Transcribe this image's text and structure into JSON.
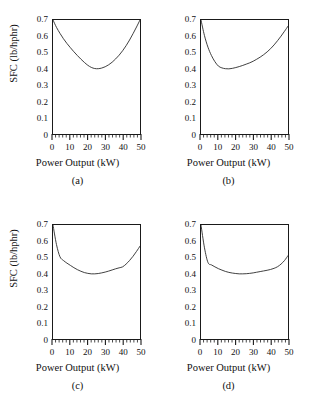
{
  "figure": {
    "background_color": "#ffffff",
    "axis_color": "#1a1a1a",
    "curve_color": "#2b2b2b"
  },
  "chart_data": [
    {
      "type": "line",
      "panel": "a",
      "caption": "(a)",
      "title": "",
      "xlabel": "Power Output (kW)",
      "ylabel": "SFC (lb/hphr)",
      "xlim": [
        0,
        50
      ],
      "ylim": [
        0,
        0.7
      ],
      "xticks": [
        0,
        10,
        20,
        30,
        40,
        50
      ],
      "xticklabels": [
        "0",
        "10",
        "20",
        "30",
        "40",
        "50"
      ],
      "yticks": [
        0,
        0.1,
        0.2,
        0.3,
        0.4,
        0.5,
        0.6,
        0.7
      ],
      "yticklabels": [
        "0",
        "0.1",
        "0.2",
        "0.3",
        "0.4",
        "0.5",
        "0.6",
        "0.7"
      ],
      "x_minor_interval": 2,
      "y_minor_interval": 0.02,
      "grid": false,
      "legend": null,
      "x": [
        0,
        2,
        4,
        6,
        8,
        10,
        12,
        14,
        16,
        18,
        20,
        22,
        24,
        26,
        28,
        30,
        32,
        34,
        36,
        38,
        40,
        42,
        44,
        46,
        48,
        50
      ],
      "y": [
        0.7,
        0.655,
        0.618,
        0.585,
        0.556,
        0.53,
        0.505,
        0.482,
        0.46,
        0.44,
        0.422,
        0.409,
        0.402,
        0.401,
        0.405,
        0.413,
        0.425,
        0.441,
        0.461,
        0.484,
        0.511,
        0.542,
        0.577,
        0.616,
        0.657,
        0.7
      ]
    },
    {
      "type": "line",
      "panel": "b",
      "caption": "(b)",
      "title": "",
      "xlabel": "Power Output (kW)",
      "ylabel": "",
      "xlim": [
        0,
        50
      ],
      "ylim": [
        0,
        0.7
      ],
      "xticks": [
        0,
        10,
        20,
        30,
        40,
        50
      ],
      "xticklabels": [
        "0",
        "10",
        "20",
        "30",
        "40",
        "50"
      ],
      "yticks": [
        0,
        0.1,
        0.2,
        0.3,
        0.4,
        0.5,
        0.6,
        0.7
      ],
      "yticklabels": [
        "0",
        "0.1",
        "0.2",
        "0.3",
        "0.4",
        "0.5",
        "0.6",
        "0.7"
      ],
      "x_minor_interval": 2,
      "y_minor_interval": 0.02,
      "grid": false,
      "legend": null,
      "x": [
        0,
        2,
        4,
        6,
        8,
        10,
        12,
        14,
        16,
        18,
        20,
        22,
        24,
        26,
        28,
        30,
        32,
        34,
        36,
        38,
        40,
        42,
        44,
        46,
        48,
        50
      ],
      "y": [
        0.7,
        0.604,
        0.533,
        0.482,
        0.444,
        0.417,
        0.406,
        0.401,
        0.4,
        0.403,
        0.408,
        0.414,
        0.421,
        0.429,
        0.437,
        0.447,
        0.459,
        0.472,
        0.487,
        0.504,
        0.524,
        0.547,
        0.573,
        0.601,
        0.631,
        0.662
      ]
    },
    {
      "type": "line",
      "panel": "c",
      "caption": "(c)",
      "title": "",
      "xlabel": "Power Output (kW)",
      "ylabel": "SFC (lb/hphr)",
      "xlim": [
        0,
        50
      ],
      "ylim": [
        0,
        0.7
      ],
      "xticks": [
        0,
        10,
        20,
        30,
        40,
        50
      ],
      "xticklabels": [
        "0",
        "10",
        "20",
        "30",
        "40",
        "50"
      ],
      "yticks": [
        0,
        0.1,
        0.2,
        0.3,
        0.4,
        0.5,
        0.6,
        0.7
      ],
      "yticklabels": [
        "0",
        "0.1",
        "0.2",
        "0.3",
        "0.4",
        "0.5",
        "0.6",
        "0.7"
      ],
      "x_minor_interval": 2,
      "y_minor_interval": 0.02,
      "grid": false,
      "legend": null,
      "x": [
        0,
        2,
        4,
        6,
        8,
        10,
        12,
        14,
        16,
        18,
        20,
        22,
        24,
        26,
        28,
        30,
        32,
        34,
        36,
        38,
        40,
        42,
        44,
        46,
        48,
        50
      ],
      "y": [
        0.7,
        0.58,
        0.505,
        0.482,
        0.466,
        0.452,
        0.438,
        0.426,
        0.416,
        0.408,
        0.403,
        0.4,
        0.4,
        0.402,
        0.406,
        0.411,
        0.417,
        0.424,
        0.431,
        0.437,
        0.443,
        0.46,
        0.482,
        0.508,
        0.538,
        0.57
      ]
    },
    {
      "type": "line",
      "panel": "d",
      "caption": "(d)",
      "title": "",
      "xlabel": "Power Output (kW)",
      "ylabel": "",
      "xlim": [
        0,
        50
      ],
      "ylim": [
        0,
        0.7
      ],
      "xticks": [
        0,
        10,
        20,
        30,
        40,
        50
      ],
      "xticklabels": [
        "0",
        "10",
        "20",
        "30",
        "40",
        "50"
      ],
      "yticks": [
        0,
        0.1,
        0.2,
        0.3,
        0.4,
        0.5,
        0.6,
        0.7
      ],
      "yticklabels": [
        "0",
        "0.1",
        "0.2",
        "0.3",
        "0.4",
        "0.5",
        "0.6",
        "0.7"
      ],
      "x_minor_interval": 2,
      "y_minor_interval": 0.02,
      "grid": false,
      "legend": null,
      "x": [
        0,
        2,
        4,
        6,
        8,
        10,
        12,
        14,
        16,
        18,
        20,
        22,
        24,
        26,
        28,
        30,
        32,
        34,
        36,
        38,
        40,
        42,
        44,
        46,
        48,
        50
      ],
      "y": [
        0.7,
        0.56,
        0.47,
        0.455,
        0.443,
        0.432,
        0.423,
        0.415,
        0.409,
        0.405,
        0.402,
        0.4,
        0.4,
        0.401,
        0.403,
        0.406,
        0.41,
        0.414,
        0.418,
        0.422,
        0.427,
        0.434,
        0.444,
        0.46,
        0.482,
        0.512
      ]
    }
  ]
}
